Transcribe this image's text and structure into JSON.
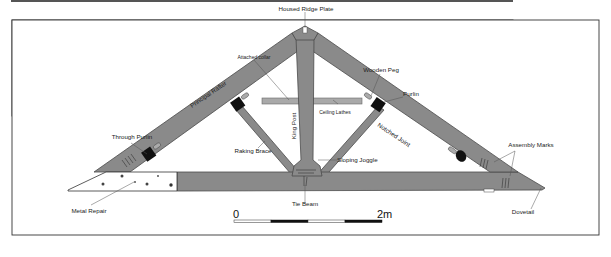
{
  "figure": {
    "frame": {
      "border_color": "#333333",
      "background": "#ffffff"
    },
    "colors": {
      "timber": "#8a8a8a",
      "timber_outline": "#4a4a4a",
      "ceiling_lathes": "#a9a9a9",
      "purlin_block": "#111111",
      "metal_repair": "#ffffff"
    }
  },
  "labels": {
    "housed_ridge_plate": "Housed Ridge Plate",
    "attached_collar": "Attached collar",
    "principal_rafter": "Principal Rafter",
    "king_post": "King Post",
    "ceiling_lathes": "Ceiling Lathes",
    "wooden_peg": "Wooden Peg",
    "purlin": "Purlin",
    "notched_joint": "Notched Joint",
    "through_purlin": "Through Purlin",
    "raking_brace": "Raking Brace",
    "sloping_joggle": "Sloping Joggle",
    "assembly_marks": "Assembly Marks",
    "metal_repair": "Metal Repair",
    "tie_beam": "Tie Beam",
    "dovetail": "Dovetail"
  },
  "scale_bar": {
    "start_label": "0",
    "end_label": "2m",
    "segments": [
      "white",
      "black",
      "white",
      "black"
    ]
  }
}
